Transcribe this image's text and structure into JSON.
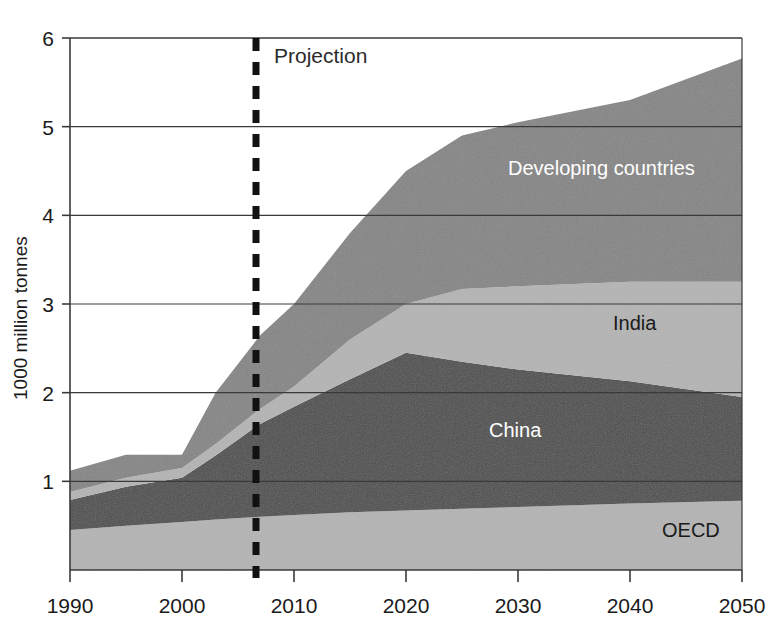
{
  "chart_data": {
    "type": "area",
    "title": "",
    "subtitle": "",
    "xlabel": "",
    "ylabel": "1000 million tonnes",
    "xlim": [
      1990,
      2050
    ],
    "ylim": [
      0,
      6
    ],
    "grid": true,
    "legend_position": "inline-labels",
    "xticks": [
      1990,
      2000,
      2010,
      2020,
      2030,
      2040,
      2050
    ],
    "yticks": [
      1,
      2,
      3,
      4,
      5,
      6
    ],
    "stacked": true,
    "stack_order_bottom_to_top": [
      "OECD",
      "China",
      "India",
      "Developing countries"
    ],
    "annotations": [
      {
        "text": "Projection",
        "x": 2007,
        "type": "vertical-dashed-line-label"
      }
    ],
    "projection_start_year": 2007,
    "x": [
      1990,
      1995,
      2000,
      2003,
      2007,
      2010,
      2015,
      2020,
      2025,
      2030,
      2040,
      2050
    ],
    "series": [
      {
        "name": "OECD",
        "color": "#b4b4b4",
        "values": [
          0.45,
          0.5,
          0.54,
          0.57,
          0.6,
          0.62,
          0.65,
          0.67,
          0.69,
          0.71,
          0.75,
          0.78
        ]
      },
      {
        "name": "China",
        "color": "#4d4d4d",
        "values": [
          0.34,
          0.44,
          0.5,
          0.72,
          1.05,
          1.22,
          1.5,
          1.78,
          1.66,
          1.55,
          1.38,
          1.17
        ]
      },
      {
        "name": "India",
        "color": "#b4b4b4",
        "values": [
          0.09,
          0.1,
          0.11,
          0.13,
          0.17,
          0.23,
          0.45,
          0.55,
          0.82,
          0.94,
          1.12,
          1.3
        ]
      },
      {
        "name": "Developing countries",
        "color": "#858585",
        "values": [
          0.24,
          0.26,
          0.15,
          0.58,
          0.83,
          0.93,
          1.2,
          1.5,
          1.73,
          1.85,
          2.05,
          2.52
        ]
      }
    ],
    "series_totals": [
      1.12,
      1.3,
      1.3,
      2.0,
      2.65,
      3.0,
      3.8,
      4.5,
      4.9,
      5.05,
      5.3,
      5.77
    ]
  },
  "axis": {
    "y_title": "1000 million tonnes",
    "y_ticks": [
      "6",
      "5",
      "4",
      "3",
      "2",
      "1"
    ],
    "x_ticks": [
      "1990",
      "2000",
      "2010",
      "2020",
      "2030",
      "2040",
      "2050"
    ]
  },
  "labels": {
    "projection": "Projection",
    "developing": "Developing countries",
    "india": "India",
    "china": "China",
    "oecd": "OECD"
  },
  "colors": {
    "oecd": "#b4b4b4",
    "china": "#4d4d4d",
    "india": "#b4b4b4",
    "developing": "#858585",
    "axis": "#3a3a3a",
    "grid": "#3a3a3a",
    "dash": "#111111",
    "text_dark": "#1a1a1a",
    "text_light": "#ffffff"
  }
}
